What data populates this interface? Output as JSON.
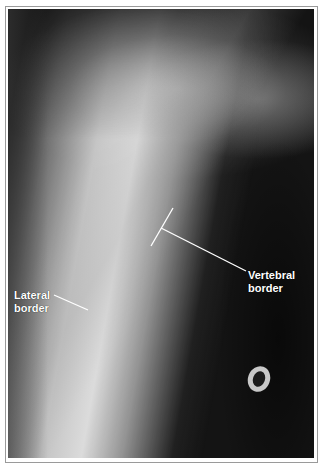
{
  "image": {
    "type": "radiograph",
    "subject": "shoulder / scapula X-ray"
  },
  "annotations": {
    "lateral": {
      "line1": "Lateral",
      "line2": "border"
    },
    "vertebral": {
      "line1": "Vertebral",
      "line2": "border"
    }
  },
  "colors": {
    "label": "#ffffff",
    "frame": "#9a9a9a"
  }
}
